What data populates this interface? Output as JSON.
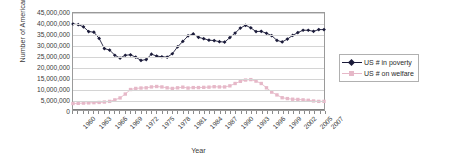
{
  "chart_data": {
    "type": "line",
    "title": "",
    "xlabel": "Year",
    "ylabel": "Number of Americans",
    "ylim": [
      0,
      45000000
    ],
    "ytick_step": 5000000,
    "ytick_labels": [
      "45,000,000",
      "40,000,000",
      "35,000,000",
      "30,000,000",
      "25,000,000",
      "20,000,000",
      "15,000,000",
      "10,000,000",
      "5,000,000",
      "0"
    ],
    "grid": true,
    "legend_position": "right",
    "x": [
      1960,
      1961,
      1962,
      1963,
      1964,
      1965,
      1966,
      1967,
      1968,
      1969,
      1970,
      1971,
      1972,
      1973,
      1974,
      1975,
      1976,
      1977,
      1978,
      1979,
      1980,
      1981,
      1982,
      1983,
      1984,
      1985,
      1986,
      1987,
      1988,
      1989,
      1990,
      1991,
      1992,
      1993,
      1994,
      1995,
      1996,
      1997,
      1998,
      1999,
      2000,
      2001,
      2002,
      2003,
      2004,
      2005,
      2006,
      2007,
      2008
    ],
    "xtick_labels": [
      "1960",
      "1963",
      "1966",
      "1969",
      "1972",
      "1975",
      "1978",
      "1981",
      "1984",
      "1987",
      "1990",
      "1993",
      "1996",
      "1999",
      "2002",
      "2005",
      "2007"
    ],
    "xtick_values": [
      1960,
      1963,
      1966,
      1969,
      1972,
      1975,
      1978,
      1981,
      1984,
      1987,
      1990,
      1993,
      1996,
      1999,
      2002,
      2005,
      2007
    ],
    "series": [
      {
        "name": "US # in poverty",
        "color": "#1b1b3a",
        "marker": "diamond",
        "values": [
          39900000,
          39600000,
          38600000,
          36400000,
          36100000,
          33200000,
          28500000,
          27800000,
          25400000,
          24100000,
          25400000,
          25600000,
          24500000,
          23000000,
          23400000,
          25900000,
          25000000,
          24700000,
          24500000,
          26100000,
          29300000,
          31800000,
          34400000,
          35300000,
          33700000,
          33100000,
          32400000,
          32200000,
          31700000,
          31500000,
          33600000,
          35700000,
          38000000,
          39300000,
          38100000,
          36400000,
          36500000,
          35600000,
          34500000,
          32300000,
          31600000,
          32900000,
          34600000,
          35900000,
          37000000,
          37000000,
          36500000,
          37300000,
          37300000
        ]
      },
      {
        "name": "US #  on welfare",
        "color": "#e6b8c8",
        "marker": "square",
        "values": [
          3000000,
          3100000,
          3200000,
          3300000,
          3400000,
          3500000,
          3700000,
          4000000,
          4700000,
          5600000,
          7400000,
          9500000,
          10000000,
          10200000,
          10300000,
          10700000,
          10900000,
          10700000,
          10300000,
          10000000,
          10300000,
          10600000,
          10200000,
          10400000,
          10400000,
          10500000,
          10600000,
          10800000,
          10700000,
          10700000,
          11200000,
          12300000,
          13300000,
          13900000,
          14100000,
          13400000,
          12300000,
          10300000,
          8300000,
          7000000,
          5700000,
          5300000,
          5000000,
          4900000,
          4700000,
          4500000,
          4200000,
          4000000,
          4000000
        ]
      }
    ]
  },
  "legend": {
    "items": [
      {
        "label": "US # in poverty"
      },
      {
        "label": "US #  on welfare"
      }
    ]
  }
}
